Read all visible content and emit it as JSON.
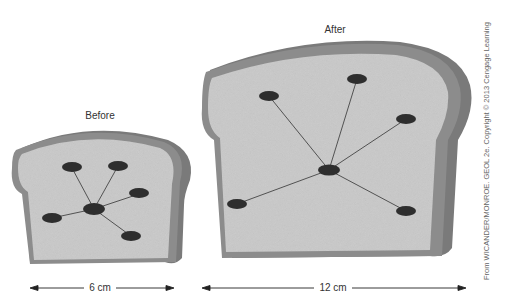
{
  "diagram": {
    "before": {
      "title": "Before",
      "width_label": "6 cm",
      "center": [
        94,
        209
      ],
      "raisins": [
        [
          72,
          168
        ],
        [
          118,
          166
        ],
        [
          139,
          194
        ],
        [
          52,
          218
        ],
        [
          131,
          236
        ]
      ]
    },
    "after": {
      "title": "After",
      "width_label": "12 cm",
      "center": [
        329,
        170
      ],
      "raisins": [
        [
          269,
          96
        ],
        [
          357,
          79
        ],
        [
          406,
          119
        ],
        [
          237,
          204
        ],
        [
          406,
          211
        ]
      ]
    },
    "credit": "From WICANDER/MONROE. GEOL 2e. Copyright © 2013 Cengage Learning",
    "colors": {
      "crumb": "#c9c9c9",
      "crust": "#8c8c8c",
      "crust_side": "#7a7a7a",
      "raisin": "#2e2e2e",
      "line": "#333333"
    }
  }
}
